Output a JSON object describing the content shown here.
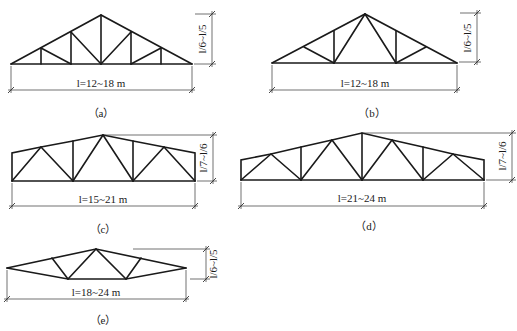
{
  "top_text_fragment": "",
  "figures": [
    {
      "id": "a",
      "caption": "（a）",
      "span_label": "l=12~18 m",
      "height_label": "l/6~l/5"
    },
    {
      "id": "b",
      "caption": "（b）",
      "span_label": "l=12~18 m",
      "height_label": "l/6~l/5"
    },
    {
      "id": "c",
      "caption": "（c）",
      "span_label": "l=15~21 m",
      "height_label": "l/7~l/6"
    },
    {
      "id": "d",
      "caption": "（d）",
      "span_label": "l=21~24 m",
      "height_label": "l/7~l/6"
    },
    {
      "id": "e",
      "caption": "（e）",
      "span_label": "l=18~24 m",
      "height_label": "l/6~l/5"
    }
  ],
  "colors": {
    "line": "#1a1a1a",
    "background": "#ffffff"
  }
}
